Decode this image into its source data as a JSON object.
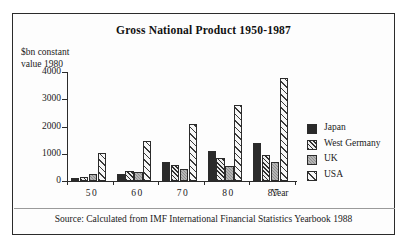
{
  "figure": {
    "title": "Gross National Product 1950-1987",
    "y_axis_caption_line1": "$bn constant",
    "y_axis_caption_line2": "value 1980",
    "x_axis_caption": "Year",
    "source_note": "Source: Calculated from IMF International Financial Statistics Yearbook 1988"
  },
  "legend": {
    "items": [
      {
        "label": "Japan",
        "swatch": "solid-black-swatch",
        "color": "#2a2a2a"
      },
      {
        "label": "West Germany",
        "swatch": "dense-hatch-swatch",
        "color": "#2f2f2f"
      },
      {
        "label": "UK",
        "swatch": "gray-dotted-swatch",
        "color": "#8e8e8e"
      },
      {
        "label": "USA",
        "swatch": "sparse-hatch-swatch",
        "color": "#3a3a3a"
      }
    ]
  },
  "chart_data": {
    "type": "bar",
    "title": "Gross National Product 1950-1987",
    "xlabel": "Year",
    "ylabel": "$bn constant value 1980",
    "categories": [
      "50",
      "60",
      "70",
      "80",
      "87"
    ],
    "yticks": [
      0,
      1000,
      2000,
      3000,
      4000
    ],
    "ylim": [
      0,
      4000
    ],
    "grid": false,
    "legend_position": "right",
    "series": [
      {
        "name": "Japan",
        "values": [
          100,
          250,
          700,
          1100,
          1400
        ]
      },
      {
        "name": "West Germany",
        "values": [
          130,
          350,
          600,
          850,
          950
        ]
      },
      {
        "name": "UK",
        "values": [
          250,
          330,
          450,
          550,
          700
        ]
      },
      {
        "name": "USA",
        "values": [
          1020,
          1470,
          2080,
          2800,
          3780
        ]
      }
    ]
  }
}
